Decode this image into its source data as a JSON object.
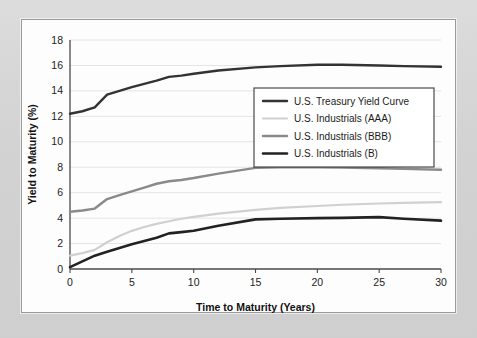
{
  "chart_data": {
    "type": "line",
    "title": "",
    "xlabel": "Time to Maturity (Years)",
    "ylabel": "Yield to Maturity (%)",
    "xlim": [
      0,
      30
    ],
    "ylim": [
      0,
      18
    ],
    "xticks": [
      0,
      5,
      10,
      15,
      20,
      25,
      30
    ],
    "yticks": [
      0,
      2,
      4,
      6,
      8,
      10,
      12,
      14,
      16,
      18
    ],
    "grid": "horizontal",
    "legend_position": "center-right",
    "x": [
      0,
      1,
      2,
      3,
      4,
      5,
      6,
      7,
      8,
      9,
      10,
      12,
      15,
      17,
      20,
      22,
      25,
      27,
      30
    ],
    "series": [
      {
        "name": "U.S. Treasury Yield Curve",
        "color": "#333333",
        "width": 2.4,
        "values": [
          12.2,
          12.4,
          12.7,
          13.7,
          14.0,
          14.3,
          14.55,
          14.8,
          15.1,
          15.2,
          15.35,
          15.6,
          15.85,
          15.95,
          16.05,
          16.05,
          16.0,
          15.95,
          15.9
        ]
      },
      {
        "name": "U.S. Industrials (AAA)",
        "color": "#d0d0d0",
        "width": 2.2,
        "values": [
          1.05,
          1.25,
          1.5,
          2.1,
          2.6,
          3.0,
          3.3,
          3.55,
          3.75,
          3.95,
          4.1,
          4.35,
          4.65,
          4.8,
          4.95,
          5.05,
          5.15,
          5.2,
          5.25
        ]
      },
      {
        "name": "U.S. Industrials (BBB)",
        "color": "#8a8a8a",
        "width": 2.4,
        "values": [
          4.5,
          4.6,
          4.75,
          5.5,
          5.8,
          6.1,
          6.4,
          6.7,
          6.9,
          7.0,
          7.15,
          7.5,
          7.95,
          8.0,
          8.0,
          7.98,
          7.92,
          7.87,
          7.8
        ]
      },
      {
        "name": "U.S. Industrials (B)",
        "color": "#222222",
        "width": 2.6,
        "values": [
          0.15,
          0.6,
          1.05,
          1.35,
          1.65,
          1.95,
          2.2,
          2.45,
          2.8,
          2.9,
          3.0,
          3.4,
          3.9,
          3.95,
          4.0,
          4.02,
          4.08,
          3.95,
          3.8
        ]
      }
    ]
  },
  "legend": {
    "entries": [
      "U.S. Treasury Yield Curve",
      "U.S. Industrials (AAA)",
      "U.S. Industrials (BBB)",
      "U.S. Industrials (B)"
    ]
  },
  "colors": {
    "panel_background": "#fdfdfd",
    "figure_background": "#d7d7d7",
    "panel_border": "#9a9a9a",
    "axis": "#4a4a4a",
    "gridline": "#e4e4e4",
    "text": "#1c1c1c"
  }
}
